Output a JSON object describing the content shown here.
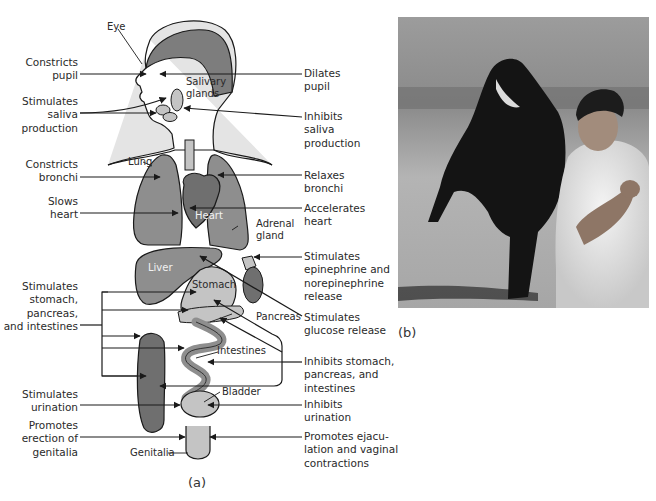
{
  "figure": {
    "panels": [
      {
        "id": "a",
        "caption": "(a)",
        "description": "Parasympathetic and sympathetic effects on body organs"
      },
      {
        "id": "b",
        "caption": "(b)",
        "description": "Photograph: man running ahead of a charging bull"
      }
    ]
  },
  "organs": {
    "eye": "Eye",
    "salivary_glands": "Salivary\nglands",
    "lung": "Lung",
    "heart": "Heart",
    "adrenal_gland": "Adrenal\ngland",
    "liver": "Liver",
    "stomach": "Stomach",
    "pancreas": "Pancreas",
    "intestines": "Intestines",
    "bladder": "Bladder",
    "genitalia": "Genitalia"
  },
  "parasympathetic_effects": [
    {
      "text": "Constricts\npupil",
      "target": "eye"
    },
    {
      "text": "Stimulates\nsaliva\nproduction",
      "target": "salivary_glands"
    },
    {
      "text": "Constricts\nbronchi",
      "target": "lung"
    },
    {
      "text": "Slows\nheart",
      "target": "heart"
    },
    {
      "text": "Stimulates\nstomach,\npancreas,\nand intestines",
      "target": "stomach_pancreas_intestines"
    },
    {
      "text": "Stimulates\nurination",
      "target": "bladder"
    },
    {
      "text": "Promotes\nerection of\ngenitalia",
      "target": "genitalia"
    }
  ],
  "sympathetic_effects": [
    {
      "text": "Dilates\npupil",
      "target": "eye"
    },
    {
      "text": "Inhibits\nsaliva\nproduction",
      "target": "salivary_glands"
    },
    {
      "text": "Relaxes\nbronchi",
      "target": "lung"
    },
    {
      "text": "Accelerates\nheart",
      "target": "heart"
    },
    {
      "text": "Stimulates\nepinephrine and\nnorepinephrine\nrelease",
      "target": "adrenal_gland"
    },
    {
      "text": "Stimulates\nglucose release",
      "target": "liver"
    },
    {
      "text": "Inhibits stomach,\npancreas, and\nintestines",
      "target": "stomach_pancreas_intestines"
    },
    {
      "text": "Inhibits\nurination",
      "target": "bladder"
    },
    {
      "text": "Promotes ejacu-\nlation and vaginal\ncontractions",
      "target": "genitalia"
    }
  ],
  "colors": {
    "line": "#1a1a1a",
    "hair": "#7d7d7d",
    "skin": "#e4e4e4",
    "organ_dark": "#6f6f6f",
    "organ_mid": "#8e8e8e",
    "organ_light": "#c4c4c4"
  }
}
